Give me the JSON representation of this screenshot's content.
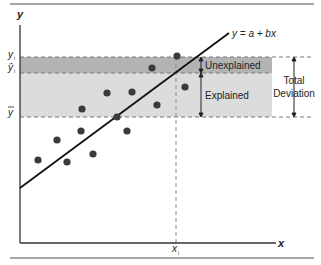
{
  "diagram": {
    "axes": {
      "y_label": "y",
      "x_label": "x",
      "xi_label": "x",
      "xi_sub": "i"
    },
    "y_markers": {
      "yi": "y",
      "yi_sub": "i",
      "yhat": "ŷ",
      "yhat_sub": "i",
      "ybar": "y"
    },
    "regression_label": "y = a + bx",
    "bands": {
      "unexplained": "Unexplained",
      "explained": "Explained",
      "total_line1": "Total",
      "total_line2": "Deviation"
    },
    "colors": {
      "unexplained_fill": "#b3b3b3",
      "explained_fill": "#dcdcdc",
      "point": "#3a3a3a",
      "line": "#111111",
      "dash": "#777777"
    },
    "points": [
      [
        38,
        160
      ],
      [
        57,
        140
      ],
      [
        67,
        162
      ],
      [
        81,
        131
      ],
      [
        82,
        109
      ],
      [
        93,
        154
      ],
      [
        107,
        93
      ],
      [
        117,
        117
      ],
      [
        127,
        131
      ],
      [
        132,
        92
      ],
      [
        152,
        68
      ],
      [
        157,
        105
      ],
      [
        177,
        56
      ],
      [
        185,
        87
      ]
    ]
  }
}
